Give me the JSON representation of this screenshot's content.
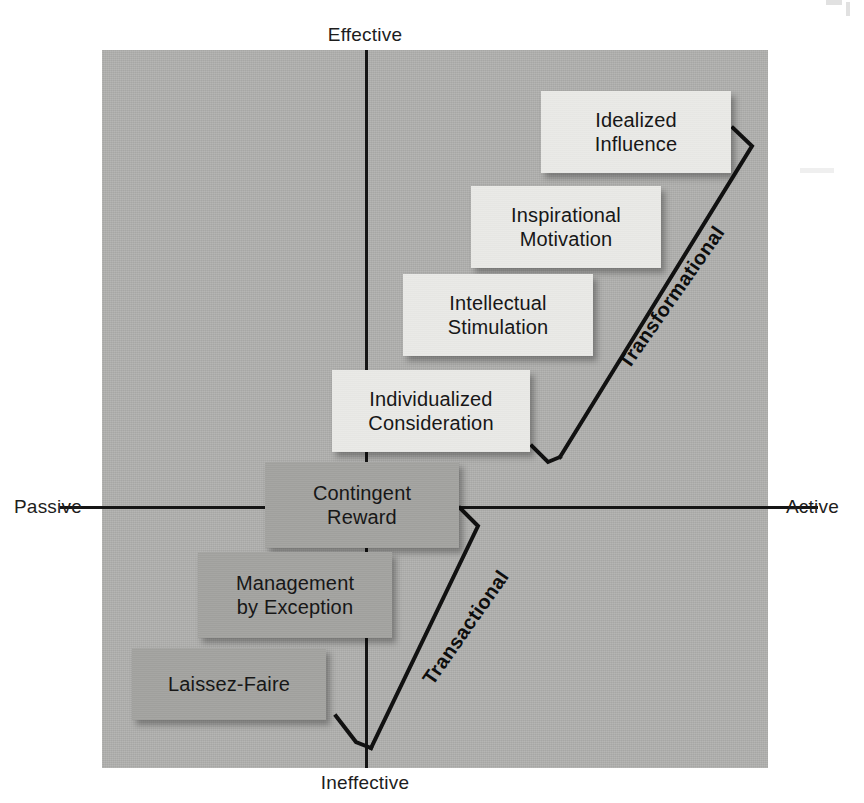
{
  "diagram": {
    "axes": {
      "top_label": "Effective",
      "bottom_label": "Ineffective",
      "left_label": "Passive",
      "right_label": "Active"
    },
    "groups": [
      {
        "id": "transformational",
        "label": "Transformational",
        "style": "light"
      },
      {
        "id": "transactional",
        "label": "Transactional",
        "style": "dark"
      }
    ],
    "nodes": [
      {
        "id": "idealized-influence",
        "line1": "Idealized",
        "line2": "Influence",
        "group": "transformational",
        "style": "light",
        "x": 541,
        "y": 91,
        "w": 190,
        "h": 82
      },
      {
        "id": "inspirational-motivation",
        "line1": "Inspirational",
        "line2": "Motivation",
        "group": "transformational",
        "style": "light",
        "x": 471,
        "y": 186,
        "w": 190,
        "h": 82
      },
      {
        "id": "intellectual-stimulation",
        "line1": "Intellectual",
        "line2": "Stimulation",
        "group": "transformational",
        "style": "light",
        "x": 403,
        "y": 274,
        "w": 190,
        "h": 82
      },
      {
        "id": "individualized-consideration",
        "line1": "Individualized",
        "line2": "Consideration",
        "group": "transformational",
        "style": "light",
        "x": 332,
        "y": 370,
        "w": 198,
        "h": 82
      },
      {
        "id": "contingent-reward",
        "line1": "Contingent",
        "line2": "Reward",
        "group": "transactional",
        "style": "dark",
        "x": 265,
        "y": 462,
        "w": 194,
        "h": 86
      },
      {
        "id": "management-by-exception",
        "line1": "Management",
        "line2": "by Exception",
        "group": "transactional",
        "style": "dark",
        "x": 198,
        "y": 552,
        "w": 194,
        "h": 86
      },
      {
        "id": "laissez-faire",
        "line1": "Laissez-Faire",
        "line2": "",
        "group": "transactional",
        "style": "dark",
        "x": 132,
        "y": 648,
        "w": 194,
        "h": 72
      }
    ],
    "colors": {
      "field": "#b0b0ae",
      "light_box": "#e9e9e6",
      "dark_box": "#a3a3a0",
      "line": "#151515",
      "text": "#171717",
      "page": "#ffffff"
    }
  }
}
